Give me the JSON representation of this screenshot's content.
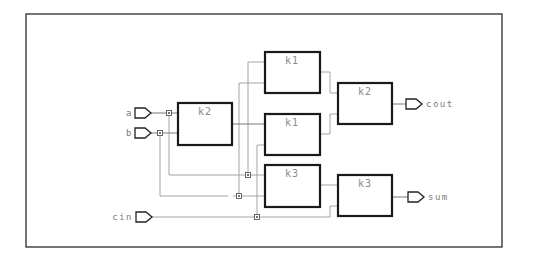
{
  "diagram": {
    "type": "logic-schematic",
    "colors": {
      "frame": "#3a3a3a",
      "block_border": "#1a1a1a",
      "wire": "#9a9a9a",
      "label": "#8a8a8a",
      "background": "#ffffff"
    },
    "inputs": [
      {
        "id": "a",
        "label": "a"
      },
      {
        "id": "b",
        "label": "b"
      },
      {
        "id": "cin",
        "label": "cin"
      }
    ],
    "outputs": [
      {
        "id": "cout",
        "label": "cout"
      },
      {
        "id": "sum",
        "label": "sum"
      }
    ],
    "blocks": [
      {
        "id": "blk_k2_left",
        "label": "k2"
      },
      {
        "id": "blk_k1_top",
        "label": "k1"
      },
      {
        "id": "blk_k1_mid",
        "label": "k1"
      },
      {
        "id": "blk_k3_left",
        "label": "k3"
      },
      {
        "id": "blk_k2_right",
        "label": "k2"
      },
      {
        "id": "blk_k3_right",
        "label": "k3"
      }
    ],
    "connections": [
      {
        "from": "a",
        "to": "blk_k2_left"
      },
      {
        "from": "b",
        "to": "blk_k2_left"
      },
      {
        "from": "a",
        "to": "blk_k3_left"
      },
      {
        "from": "b",
        "to": "blk_k3_left"
      },
      {
        "from": "cin",
        "to": "blk_k3_right"
      },
      {
        "from": "cin",
        "to": "blk_k1_mid"
      },
      {
        "from": "blk_k2_left",
        "to": "blk_k1_mid"
      },
      {
        "from": "a",
        "to": "blk_k1_top"
      },
      {
        "from": "b",
        "to": "blk_k1_top"
      },
      {
        "from": "blk_k1_top",
        "to": "blk_k2_right"
      },
      {
        "from": "blk_k1_mid",
        "to": "blk_k2_right"
      },
      {
        "from": "blk_k3_left",
        "to": "blk_k3_right"
      },
      {
        "from": "blk_k2_right",
        "to": "cout"
      },
      {
        "from": "blk_k3_right",
        "to": "sum"
      }
    ]
  }
}
